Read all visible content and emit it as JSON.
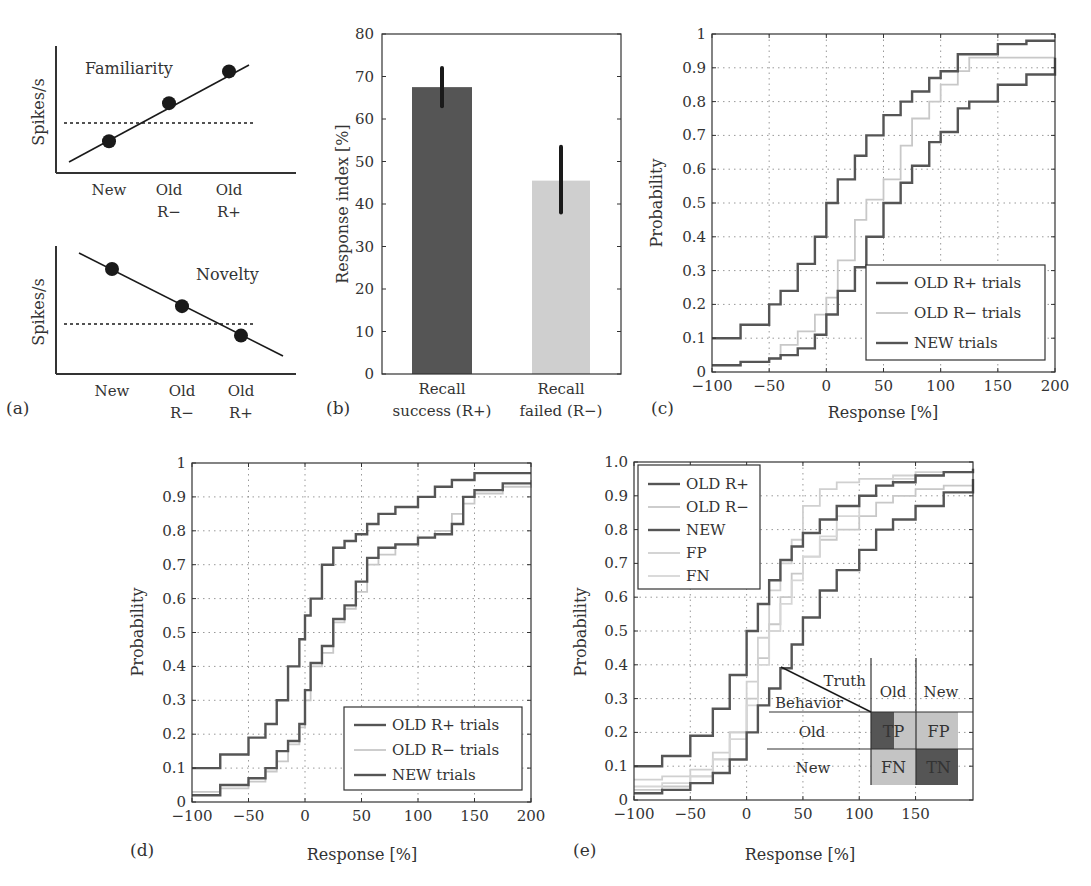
{
  "colors": {
    "dark": "#555555",
    "light": "#c8c8c8",
    "black": "#1a1a1a",
    "axis": "#333333",
    "grid": "#999999"
  },
  "panel_labels": [
    "(a)",
    "(b)",
    "(c)",
    "(d)",
    "(e)"
  ],
  "chart_data": [
    {
      "id": "a-top",
      "type": "scatter",
      "title": "Familiarity",
      "ylabel": "Spikes/s",
      "categories": [
        "New",
        "Old\nR−",
        "Old\nR+"
      ],
      "values": [
        0.25,
        0.55,
        0.8
      ],
      "baseline": 0.4,
      "trend": "increasing",
      "ylim": [
        0,
        1
      ],
      "grid": false
    },
    {
      "id": "a-bottom",
      "type": "scatter",
      "title": "Novelty",
      "ylabel": "Spikes/s",
      "categories": [
        "New",
        "Old\nR−",
        "Old\nR+"
      ],
      "values": [
        0.82,
        0.53,
        0.3
      ],
      "baseline": 0.4,
      "trend": "decreasing",
      "ylim": [
        0,
        1
      ],
      "grid": false
    },
    {
      "id": "b",
      "type": "bar",
      "title": "",
      "xlabel": "",
      "ylabel": "Response index [%]",
      "categories": [
        "Recall\nsuccess (R+)",
        "Recall\nfailed (R−)"
      ],
      "values": [
        67.5,
        45.5
      ],
      "errors": [
        [
          63,
          72
        ],
        [
          38,
          53.5
        ]
      ],
      "bar_colors": [
        "#555555",
        "#cfcfcf"
      ],
      "ylim": [
        0,
        80
      ],
      "yticks": [
        0,
        10,
        20,
        30,
        40,
        50,
        60,
        70,
        80
      ],
      "grid": false
    },
    {
      "id": "c",
      "type": "line",
      "title": "",
      "xlabel": "Response [%]",
      "ylabel": "Probability",
      "xlim": [
        -100,
        200
      ],
      "ylim": [
        0,
        1
      ],
      "xticks": [
        -100,
        -50,
        0,
        50,
        100,
        150,
        200
      ],
      "yticks": [
        0,
        0.1,
        0.2,
        0.3,
        0.4,
        0.5,
        0.6,
        0.7,
        0.8,
        0.9,
        1
      ],
      "ytick_labels": [
        "0",
        "0.1",
        "0.2",
        "0.3",
        "0.4",
        "0.5",
        "0.6",
        "0.7",
        "0.8",
        "0.9",
        "1"
      ],
      "grid": true,
      "legend_position": "lower right",
      "x": [
        -100,
        -75,
        -50,
        -40,
        -25,
        -10,
        0,
        10,
        25,
        35,
        50,
        65,
        75,
        90,
        100,
        115,
        125,
        150,
        175,
        200
      ],
      "series": [
        {
          "name": "OLD R+ trials",
          "color": "#555555",
          "values": [
            0.1,
            0.14,
            0.2,
            0.24,
            0.32,
            0.4,
            0.5,
            0.57,
            0.64,
            0.7,
            0.76,
            0.8,
            0.83,
            0.87,
            0.89,
            0.94,
            0.94,
            0.97,
            0.98,
            0.98
          ]
        },
        {
          "name": "OLD R− trials",
          "color": "#c8c8c8",
          "values": [
            0.02,
            0.03,
            0.04,
            0.08,
            0.12,
            0.17,
            0.22,
            0.33,
            0.45,
            0.51,
            0.57,
            0.67,
            0.75,
            0.8,
            0.85,
            0.89,
            0.93,
            0.93,
            0.93,
            0.93
          ]
        },
        {
          "name": "NEW trials",
          "color": "#555555",
          "values": [
            0.02,
            0.03,
            0.04,
            0.05,
            0.07,
            0.11,
            0.17,
            0.24,
            0.31,
            0.4,
            0.5,
            0.56,
            0.61,
            0.68,
            0.71,
            0.78,
            0.8,
            0.85,
            0.88,
            0.93
          ]
        }
      ]
    },
    {
      "id": "d",
      "type": "line",
      "title": "",
      "xlabel": "Response [%]",
      "ylabel": "Probability",
      "xlim": [
        -100,
        200
      ],
      "ylim": [
        0,
        1
      ],
      "xticks": [
        -100,
        -50,
        0,
        50,
        100,
        150,
        200
      ],
      "yticks": [
        0,
        0.1,
        0.2,
        0.3,
        0.4,
        0.5,
        0.6,
        0.7,
        0.8,
        0.9,
        1
      ],
      "ytick_labels": [
        "0",
        "0.1",
        "0.2",
        "0.3",
        "0.4",
        "0.5",
        "0.6",
        "0.7",
        "0.8",
        "0.9",
        "1"
      ],
      "grid": true,
      "legend_position": "lower right",
      "x": [
        -100,
        -75,
        -50,
        -35,
        -25,
        -15,
        -5,
        0,
        5,
        15,
        25,
        35,
        45,
        55,
        65,
        80,
        100,
        115,
        130,
        140,
        150,
        175,
        200
      ],
      "series": [
        {
          "name": "OLD R+ trials",
          "color": "#555555",
          "values": [
            0.1,
            0.14,
            0.19,
            0.23,
            0.3,
            0.4,
            0.48,
            0.55,
            0.6,
            0.7,
            0.75,
            0.77,
            0.79,
            0.82,
            0.85,
            0.87,
            0.9,
            0.93,
            0.95,
            0.95,
            0.97,
            0.97,
            0.97
          ]
        },
        {
          "name": "OLD R− trials",
          "color": "#c8c8c8",
          "values": [
            0.03,
            0.04,
            0.06,
            0.09,
            0.12,
            0.17,
            0.22,
            0.3,
            0.4,
            0.44,
            0.53,
            0.57,
            0.62,
            0.7,
            0.73,
            0.76,
            0.78,
            0.8,
            0.85,
            0.88,
            0.91,
            0.93,
            0.95
          ]
        },
        {
          "name": "NEW trials",
          "color": "#555555",
          "values": [
            0.02,
            0.05,
            0.07,
            0.1,
            0.15,
            0.18,
            0.23,
            0.33,
            0.41,
            0.46,
            0.54,
            0.58,
            0.65,
            0.72,
            0.75,
            0.76,
            0.78,
            0.79,
            0.82,
            0.9,
            0.92,
            0.94,
            0.94
          ]
        }
      ]
    },
    {
      "id": "e",
      "type": "line",
      "title": "",
      "xlabel": "Response [%]",
      "ylabel": "Probability",
      "xlim": [
        -100,
        201
      ],
      "ylim": [
        0,
        1
      ],
      "xticks": [
        -100,
        -50,
        0,
        50,
        100,
        150
      ],
      "yticks": [
        0,
        0.1,
        0.2,
        0.3,
        0.4,
        0.5,
        0.6,
        0.7,
        0.8,
        0.9,
        1.0
      ],
      "ytick_labels": [
        "0",
        "0.1",
        "0.2",
        "0.3",
        "0.4",
        "0.5",
        "0.6",
        "0.7",
        "0.8",
        "0.9",
        "1.0"
      ],
      "grid": true,
      "legend_position": "upper left",
      "x": [
        -100,
        -75,
        -50,
        -30,
        -15,
        0,
        10,
        20,
        30,
        40,
        50,
        65,
        80,
        100,
        115,
        130,
        150,
        175,
        201
      ],
      "series": [
        {
          "name": "OLD R+",
          "color": "#555555",
          "values": [
            0.1,
            0.13,
            0.19,
            0.27,
            0.37,
            0.5,
            0.58,
            0.65,
            0.71,
            0.75,
            0.79,
            0.83,
            0.87,
            0.9,
            0.93,
            0.94,
            0.96,
            0.97,
            0.98
          ]
        },
        {
          "name": "OLD R−",
          "color": "#c8c8c8",
          "values": [
            0.03,
            0.04,
            0.07,
            0.12,
            0.2,
            0.3,
            0.42,
            0.52,
            0.6,
            0.67,
            0.72,
            0.77,
            0.8,
            0.84,
            0.88,
            0.9,
            0.92,
            0.93,
            0.95
          ]
        },
        {
          "name": "NEW",
          "color": "#555555",
          "values": [
            0.02,
            0.03,
            0.05,
            0.08,
            0.12,
            0.2,
            0.28,
            0.33,
            0.39,
            0.46,
            0.54,
            0.62,
            0.68,
            0.74,
            0.8,
            0.83,
            0.87,
            0.91,
            0.95
          ]
        },
        {
          "name": "FP",
          "color": "#d0d0d0",
          "values": [
            0.06,
            0.07,
            0.09,
            0.14,
            0.2,
            0.35,
            0.48,
            0.62,
            0.7,
            0.77,
            0.87,
            0.92,
            0.94,
            0.95,
            0.95,
            0.96,
            0.97,
            0.97,
            0.97
          ]
        },
        {
          "name": "FN",
          "color": "#d6d6d6",
          "values": [
            0.04,
            0.05,
            0.07,
            0.12,
            0.18,
            0.28,
            0.4,
            0.5,
            0.58,
            0.65,
            0.72,
            0.78,
            0.84,
            0.9,
            0.93,
            0.95,
            0.96,
            0.97,
            0.98
          ]
        }
      ],
      "inset": {
        "truth_label": "Truth",
        "behavior_label": "Behavior",
        "col_headers": [
          "Old",
          "New"
        ],
        "row_headers": [
          "Old",
          "New"
        ],
        "cells": [
          [
            "TP",
            "FP"
          ],
          [
            "FN",
            "TN"
          ]
        ],
        "cell_colors": [
          [
            "#555555",
            "#c4c4c4"
          ],
          [
            "#c4c4c4",
            "#555555"
          ]
        ]
      }
    }
  ]
}
